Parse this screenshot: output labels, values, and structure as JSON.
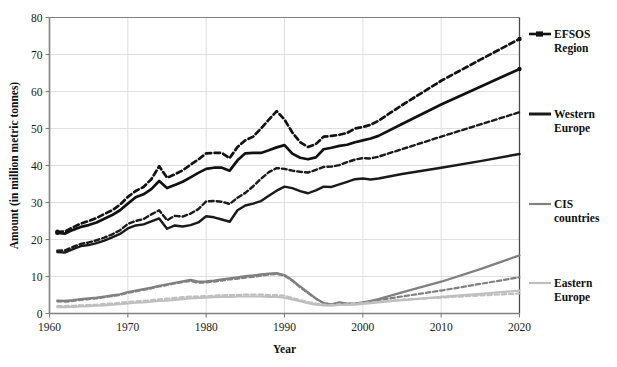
{
  "chart_data": {
    "type": "line",
    "title": "",
    "xlabel": "Year",
    "ylabel": "Amount (in million metric tonnes)",
    "xlim": [
      1960,
      2020
    ],
    "ylim": [
      0,
      80
    ],
    "xticks": [
      1960,
      1970,
      1980,
      1990,
      2000,
      2010,
      2020
    ],
    "yticks": [
      0,
      10,
      20,
      30,
      40,
      50,
      60,
      70,
      80
    ],
    "grid": "horizontal-and-vertical-light",
    "legend_position": "right",
    "colors": {
      "efsos_region": "#111111",
      "western_europe": "#1a1a1a",
      "cis_countries": "#808080",
      "eastern_europe": "#bfbfbf"
    },
    "series": [
      {
        "name": "EFSOS Region",
        "legend_key": "efsos_region",
        "style": "solid-with-marker",
        "color": "#111111",
        "x": [
          1961,
          1962,
          1963,
          1964,
          1965,
          1966,
          1967,
          1968,
          1969,
          1970,
          1971,
          1972,
          1973,
          1974,
          1975,
          1976,
          1977,
          1978,
          1979,
          1980,
          1981,
          1982,
          1983,
          1984,
          1985,
          1986,
          1987,
          1988,
          1989,
          1990,
          1991,
          1992,
          1993,
          1994,
          1995,
          1996,
          1997,
          1998,
          1999,
          2000,
          2001,
          2002,
          2005,
          2010,
          2015,
          2020
        ],
        "values": [
          21.8,
          21.6,
          22.6,
          23.4,
          23.9,
          24.6,
          25.6,
          26.6,
          27.9,
          29.7,
          31.4,
          32.2,
          33.6,
          35.8,
          33.9,
          34.7,
          35.6,
          36.8,
          38.0,
          39.1,
          39.4,
          39.4,
          38.6,
          41.4,
          43.3,
          43.4,
          43.4,
          44.1,
          44.9,
          45.5,
          43.2,
          42.1,
          41.7,
          42.2,
          44.4,
          44.8,
          45.3,
          45.6,
          46.3,
          46.8,
          47.3,
          48.0,
          51.2,
          56.5,
          61.3,
          66.1
        ]
      },
      {
        "name": "EFSOS Region (dashed scenario)",
        "legend_key": "efsos_region",
        "style": "dashed",
        "color": "#111111",
        "x": [
          1961,
          1962,
          1963,
          1964,
          1965,
          1966,
          1967,
          1968,
          1969,
          1970,
          1971,
          1972,
          1973,
          1974,
          1975,
          1976,
          1977,
          1978,
          1979,
          1980,
          1981,
          1982,
          1983,
          1984,
          1985,
          1986,
          1987,
          1988,
          1989,
          1990,
          1991,
          1992,
          1993,
          1994,
          1995,
          1996,
          1997,
          1998,
          1999,
          2000,
          2001,
          2002,
          2005,
          2010,
          2015,
          2020
        ],
        "values": [
          22.1,
          22.2,
          23.3,
          24.3,
          25.0,
          25.8,
          26.9,
          27.9,
          29.4,
          31.5,
          33.1,
          34.2,
          36.3,
          39.8,
          36.7,
          37.6,
          38.7,
          40.2,
          41.6,
          43.3,
          43.4,
          43.4,
          42.0,
          45.0,
          46.8,
          47.8,
          50.0,
          52.4,
          54.7,
          52.4,
          48.9,
          46.3,
          45.0,
          45.8,
          47.8,
          48.0,
          48.3,
          48.8,
          50.0,
          50.4,
          51.0,
          52.1,
          56.3,
          62.9,
          68.6,
          74.2
        ]
      },
      {
        "name": "Western Europe",
        "legend_key": "western_europe",
        "style": "solid",
        "color": "#1a1a1a",
        "x": [
          1961,
          1962,
          1963,
          1964,
          1965,
          1966,
          1967,
          1968,
          1969,
          1970,
          1971,
          1972,
          1973,
          1974,
          1975,
          1976,
          1977,
          1978,
          1979,
          1980,
          1981,
          1982,
          1983,
          1984,
          1985,
          1986,
          1987,
          1988,
          1989,
          1990,
          1991,
          1992,
          1993,
          1994,
          1995,
          1996,
          1997,
          1998,
          1999,
          2000,
          2001,
          2002,
          2005,
          2010,
          2015,
          2020
        ],
        "values": [
          16.6,
          16.5,
          17.4,
          18.2,
          18.5,
          19.0,
          19.7,
          20.6,
          21.5,
          23.0,
          23.8,
          24.1,
          24.9,
          25.7,
          22.9,
          23.8,
          23.5,
          23.9,
          24.6,
          26.3,
          26.0,
          25.4,
          24.8,
          27.9,
          29.2,
          29.7,
          30.4,
          31.8,
          33.2,
          34.3,
          33.9,
          33.1,
          32.5,
          33.3,
          34.3,
          34.2,
          34.9,
          35.6,
          36.3,
          36.5,
          36.2,
          36.5,
          37.7,
          39.4,
          41.2,
          43.1
        ]
      },
      {
        "name": "Western Europe (dashed scenario)",
        "legend_key": "western_europe",
        "style": "dashed",
        "color": "#1a1a1a",
        "x": [
          1961,
          1962,
          1963,
          1964,
          1965,
          1966,
          1967,
          1968,
          1969,
          1970,
          1971,
          1972,
          1973,
          1974,
          1975,
          1976,
          1977,
          1978,
          1979,
          1980,
          1981,
          1982,
          1983,
          1984,
          1985,
          1986,
          1987,
          1988,
          1989,
          1990,
          1991,
          1992,
          1993,
          1994,
          1995,
          1996,
          1997,
          1998,
          1999,
          2000,
          2001,
          2002,
          2005,
          2010,
          2015,
          2020
        ],
        "values": [
          17.0,
          17.1,
          18.0,
          18.8,
          19.2,
          19.8,
          20.5,
          21.4,
          22.5,
          24.2,
          25.0,
          25.5,
          26.8,
          27.9,
          25.2,
          26.4,
          26.2,
          27.0,
          28.2,
          30.3,
          30.4,
          30.2,
          29.6,
          31.3,
          32.6,
          34.4,
          36.4,
          38.2,
          39.3,
          39.1,
          38.6,
          38.3,
          38.1,
          38.8,
          39.6,
          39.7,
          40.1,
          40.9,
          41.6,
          42.0,
          41.9,
          42.4,
          44.4,
          47.8,
          51.1,
          54.4
        ]
      },
      {
        "name": "CIS countries",
        "legend_key": "cis_countries",
        "style": "solid",
        "color": "#808080",
        "x": [
          1961,
          1962,
          1963,
          1964,
          1965,
          1966,
          1967,
          1968,
          1969,
          1970,
          1971,
          1972,
          1973,
          1974,
          1975,
          1976,
          1977,
          1978,
          1979,
          1980,
          1981,
          1982,
          1983,
          1984,
          1985,
          1986,
          1987,
          1988,
          1989,
          1990,
          1991,
          1992,
          1993,
          1994,
          1995,
          1996,
          1997,
          1998,
          1999,
          2000,
          2001,
          2002,
          2005,
          2010,
          2015,
          2020
        ],
        "values": [
          3.5,
          3.4,
          3.6,
          3.9,
          4.1,
          4.3,
          4.6,
          4.9,
          5.2,
          5.8,
          6.2,
          6.6,
          7.0,
          7.5,
          7.9,
          8.3,
          8.7,
          9.1,
          8.6,
          8.7,
          8.9,
          9.2,
          9.5,
          9.8,
          10.1,
          10.3,
          10.6,
          10.8,
          10.9,
          10.4,
          9.0,
          7.3,
          5.7,
          4.1,
          2.8,
          2.5,
          3.0,
          2.7,
          2.7,
          3.0,
          3.4,
          3.9,
          5.7,
          8.6,
          12.0,
          15.7
        ]
      },
      {
        "name": "CIS countries (dashed scenario)",
        "legend_key": "cis_countries",
        "style": "dashed",
        "color": "#808080",
        "x": [
          1961,
          1962,
          1963,
          1964,
          1965,
          1966,
          1967,
          1968,
          1969,
          1970,
          1971,
          1972,
          1973,
          1974,
          1975,
          1976,
          1977,
          1978,
          1979,
          1980,
          1981,
          1982,
          1983,
          1984,
          1985,
          1986,
          1987,
          1988,
          1989,
          1990,
          1991,
          1992,
          1993,
          1994,
          1995,
          1996,
          1997,
          1998,
          1999,
          2000,
          2001,
          2002,
          2005,
          2010,
          2015,
          2020
        ],
        "values": [
          3.3,
          3.2,
          3.4,
          3.7,
          3.9,
          4.1,
          4.4,
          4.7,
          5.0,
          5.6,
          6.0,
          6.4,
          6.8,
          7.3,
          7.7,
          8.1,
          8.5,
          8.8,
          8.3,
          8.4,
          8.6,
          8.9,
          9.2,
          9.4,
          9.7,
          9.9,
          10.2,
          10.5,
          10.7,
          10.2,
          8.8,
          7.1,
          5.5,
          4.0,
          2.7,
          2.4,
          2.9,
          2.6,
          2.6,
          2.9,
          3.2,
          3.6,
          4.6,
          6.2,
          8.0,
          9.8
        ]
      },
      {
        "name": "Eastern Europe",
        "legend_key": "eastern_europe",
        "style": "solid",
        "color": "#bfbfbf",
        "x": [
          1961,
          1962,
          1963,
          1964,
          1965,
          1966,
          1967,
          1968,
          1969,
          1970,
          1971,
          1972,
          1973,
          1974,
          1975,
          1976,
          1977,
          1978,
          1979,
          1980,
          1981,
          1982,
          1983,
          1984,
          1985,
          1986,
          1987,
          1988,
          1989,
          1990,
          1991,
          1992,
          1993,
          1994,
          1995,
          1996,
          1997,
          1998,
          1999,
          2000,
          2001,
          2002,
          2005,
          2010,
          2015,
          2020
        ],
        "values": [
          1.7,
          1.7,
          1.8,
          1.9,
          2.0,
          2.1,
          2.2,
          2.4,
          2.5,
          2.7,
          2.9,
          3.0,
          3.2,
          3.4,
          3.5,
          3.7,
          3.9,
          4.1,
          4.2,
          4.3,
          4.4,
          4.5,
          4.5,
          4.6,
          4.6,
          4.6,
          4.6,
          4.5,
          4.5,
          4.3,
          3.8,
          3.3,
          2.8,
          2.4,
          2.2,
          2.1,
          2.3,
          2.3,
          2.4,
          2.6,
          2.8,
          3.0,
          3.6,
          4.5,
          5.3,
          6.2
        ]
      },
      {
        "name": "Eastern Europe (dashed scenario)",
        "legend_key": "eastern_europe",
        "style": "dashed",
        "color": "#bfbfbf",
        "x": [
          1961,
          1962,
          1963,
          1964,
          1965,
          1966,
          1967,
          1968,
          1969,
          1970,
          1971,
          1972,
          1973,
          1974,
          1975,
          1976,
          1977,
          1978,
          1979,
          1980,
          1981,
          1982,
          1983,
          1984,
          1985,
          1986,
          1987,
          1988,
          1989,
          1990,
          1991,
          1992,
          1993,
          1994,
          1995,
          1996,
          1997,
          1998,
          1999,
          2000,
          2001,
          2002,
          2005,
          2010,
          2015,
          2020
        ],
        "values": [
          2.0,
          2.0,
          2.1,
          2.2,
          2.3,
          2.4,
          2.6,
          2.7,
          2.9,
          3.1,
          3.3,
          3.4,
          3.6,
          3.8,
          4.0,
          4.2,
          4.4,
          4.6,
          4.6,
          4.7,
          4.8,
          4.9,
          5.0,
          5.0,
          5.1,
          5.1,
          5.1,
          5.0,
          5.0,
          4.8,
          4.2,
          3.6,
          3.1,
          2.7,
          2.4,
          2.3,
          2.5,
          2.5,
          2.6,
          2.8,
          3.0,
          3.2,
          3.7,
          4.3,
          4.9,
          5.4
        ]
      }
    ]
  },
  "legend": {
    "items": [
      {
        "label_line1": "EFSOS",
        "label_line2": "Region",
        "color": "#111111",
        "marker": true,
        "thickness": 2.6
      },
      {
        "label_line1": "Western",
        "label_line2": "Europe",
        "color": "#1a1a1a",
        "marker": false,
        "thickness": 3.0
      },
      {
        "label_line1": "CIS",
        "label_line2": "countries",
        "color": "#808080",
        "marker": false,
        "thickness": 2.2
      },
      {
        "label_line1": "Eastern",
        "label_line2": "Europe",
        "color": "#bfbfbf",
        "marker": false,
        "thickness": 2.2
      }
    ]
  },
  "axes": {
    "y_title": "Amount (in million metric tonnes)",
    "x_title": "Year",
    "y_tick_labels": [
      "80",
      "70",
      "60",
      "50",
      "40",
      "30",
      "20",
      "10",
      "0"
    ],
    "x_tick_labels": [
      "1960",
      "1970",
      "1980",
      "1990",
      "2000",
      "2010",
      "2020"
    ]
  }
}
